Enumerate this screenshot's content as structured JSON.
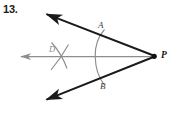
{
  "figure": {
    "problem_number": "13.",
    "type": "angle-bisector-construction",
    "background_color": "#ffffff",
    "ray_color": "#1a1a1a",
    "construction_color": "#8d8d8d",
    "vertex": {
      "name": "P",
      "label": "P",
      "x": 154,
      "y": 56
    },
    "points": [
      {
        "name": "A",
        "label": "A",
        "x": 103,
        "y": 31,
        "label_x": 98,
        "label_y": 21
      },
      {
        "name": "B",
        "label": "B",
        "x": 103,
        "y": 83,
        "label_x": 100,
        "label_y": 82
      },
      {
        "name": "D",
        "label": "D",
        "x": 58,
        "y": 56,
        "label_x": 49,
        "label_y": 45
      }
    ],
    "rays": [
      {
        "name": "upper-ray",
        "from": "P",
        "to_x": 43,
        "to_y": 12,
        "arrow": true,
        "color": "#1a1a1a"
      },
      {
        "name": "lower-ray",
        "from": "P",
        "to_x": 43,
        "to_y": 102,
        "arrow": true,
        "color": "#1a1a1a"
      },
      {
        "name": "bisector-ray",
        "from": "P",
        "to_x": 18,
        "to_y": 56,
        "arrow": true,
        "color": "#8d8d8d"
      }
    ],
    "arcs": [
      {
        "name": "arc-AB",
        "description": "compass arc through A and B centered at P",
        "color": "#8d8d8d"
      },
      {
        "name": "arc-from-A",
        "description": "compass arc from A crossing at D",
        "color": "#8d8d8d"
      },
      {
        "name": "arc-from-B",
        "description": "compass arc from B crossing at D",
        "color": "#8d8d8d"
      }
    ]
  }
}
